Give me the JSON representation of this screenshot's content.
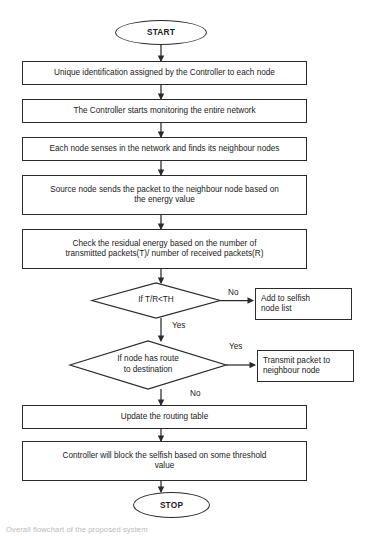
{
  "diagram": {
    "type": "flowchart",
    "title_caption": "Overall flowchart of the proposed system",
    "stroke_color": "#2b2b2b",
    "text_color": "#1a1a1a",
    "background": "#ffffff",
    "nodes": {
      "start": {
        "shape": "terminator",
        "label": "START"
      },
      "step1": {
        "shape": "process",
        "label": "Unique identification assigned by the Controller to each node"
      },
      "step2": {
        "shape": "process",
        "label": "The Controller starts monitoring the entire network"
      },
      "step3": {
        "shape": "process",
        "label": "Each node senses in the network and finds its neighbour nodes"
      },
      "step4": {
        "shape": "process",
        "label": "Source node sends the packet to the neighbour node based on\nthe energy value"
      },
      "step5": {
        "shape": "process",
        "label": "Check the residual energy based on the number of\ntransmitted packets(T)/ number of received packets(R)"
      },
      "decision1": {
        "shape": "decision",
        "label": "If T/R<TH"
      },
      "selfish_list": {
        "shape": "process",
        "label": "Add to selfish\nnode list"
      },
      "decision2": {
        "shape": "decision",
        "label": "If node has route\nto destination"
      },
      "transmit": {
        "shape": "process",
        "label": "Transmit packet to\nneighbour node"
      },
      "step6": {
        "shape": "process",
        "label": "Update the routing table"
      },
      "step7": {
        "shape": "process",
        "label": "Controller will block the selfish based on some threshold\nvalue"
      },
      "stop": {
        "shape": "terminator",
        "label": "STOP"
      }
    },
    "edge_labels": {
      "decision1_no": "No",
      "decision1_yes": "Yes",
      "decision2_yes": "Yes",
      "decision2_no": "No"
    }
  }
}
